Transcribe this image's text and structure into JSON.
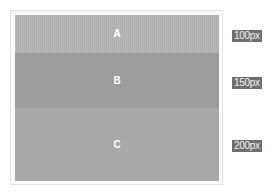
{
  "diagram": {
    "bands": [
      {
        "label": "A",
        "size_label": "100px",
        "color": "#b5b5b5"
      },
      {
        "label": "B",
        "size_label": "150px",
        "color": "#9c9c9c"
      },
      {
        "label": "C",
        "size_label": "200px",
        "color": "#a9a9a9"
      }
    ],
    "badge_color": "#6f6f6f"
  }
}
